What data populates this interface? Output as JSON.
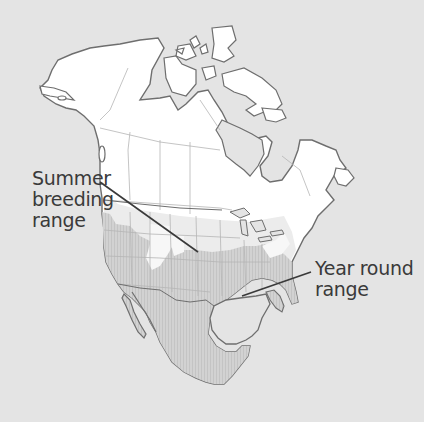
{
  "map": {
    "region": "North America",
    "colors": {
      "background": "#e4e4e4",
      "land_no_range": "#ffffff",
      "summer_breeding_range": "#f2f2f2",
      "year_round_range": "#cfcfcf",
      "coastline": "#6e6e6e",
      "borders": "#b5b5b5",
      "leader_line": "#3a3a3a"
    }
  },
  "labels": {
    "summer": {
      "line1": "Summer",
      "line2": "breeding",
      "line3": "range"
    },
    "year_round": {
      "line1": "Year round",
      "line2": "range"
    }
  }
}
